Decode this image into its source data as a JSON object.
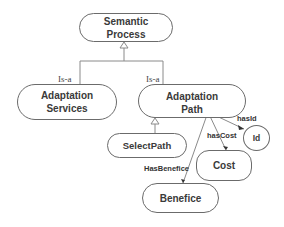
{
  "diagram": {
    "nodes": {
      "semantic_process": {
        "label": "Semantic\nProcess"
      },
      "adaptation_services": {
        "label": "Adaptation\nServices"
      },
      "adaptation_path": {
        "label": "Adaptation\nPath"
      },
      "select_path": {
        "label": "SelectPath"
      },
      "id": {
        "label": "Id"
      },
      "cost": {
        "label": "Cost"
      },
      "benefice": {
        "label": "Benefice"
      }
    },
    "edges": {
      "isa_services": {
        "label": "Is-a"
      },
      "isa_path": {
        "label": "Is-a"
      },
      "has_id": {
        "label": "hasId"
      },
      "has_cost": {
        "label": "hasCost"
      },
      "has_benefice": {
        "label": "HasBenefice"
      }
    },
    "colors": {
      "stroke": "#6b6b6b",
      "text": "#3a3a3a",
      "background": "#ffffff"
    }
  }
}
